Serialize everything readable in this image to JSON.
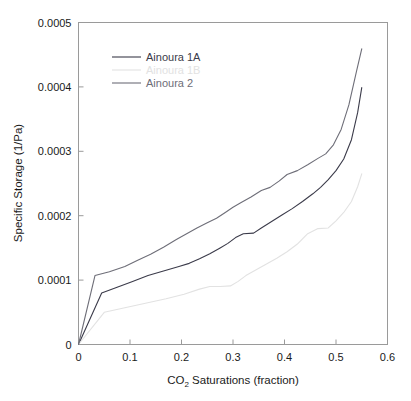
{
  "chart_data": {
    "type": "line",
    "title": "",
    "xlabel": "CO2 Saturations (fraction)",
    "xlabel_main": "CO",
    "xlabel_sub": "2",
    "xlabel_rest": " Saturations (fraction)",
    "ylabel": "Specific Storage (1/Pa)",
    "xlim": [
      0,
      0.6
    ],
    "ylim": [
      0,
      0.0005
    ],
    "xticks": [
      0,
      0.1,
      0.2,
      0.3,
      0.4,
      0.5,
      0.6
    ],
    "xtick_labels": [
      "0",
      "0.1",
      "0.2",
      "0.3",
      "0.4",
      "0.5",
      "0.6"
    ],
    "yticks": [
      0,
      0.0001,
      0.0002,
      0.0003,
      0.0004,
      0.0005
    ],
    "ytick_labels": [
      "0",
      "0.0001",
      "0.0002",
      "0.0003",
      "0.0004",
      "0.0005"
    ],
    "grid": false,
    "legend_position": "upper-left-inside",
    "series": [
      {
        "name": "Ainoura 1A",
        "color": "#3b3b4a",
        "x": [
          0.0,
          0.045,
          0.075,
          0.105,
          0.135,
          0.165,
          0.195,
          0.215,
          0.235,
          0.255,
          0.275,
          0.29,
          0.305,
          0.32,
          0.34,
          0.355,
          0.375,
          0.395,
          0.415,
          0.435,
          0.455,
          0.47,
          0.485,
          0.5,
          0.515,
          0.53,
          0.542,
          0.55
        ],
        "y": [
          0.0,
          8e-05,
          8.9e-05,
          9.8e-05,
          0.000107,
          0.000114,
          0.000121,
          0.000126,
          0.000133,
          0.000141,
          0.00015,
          0.000157,
          0.000166,
          0.000172,
          0.000173,
          0.000181,
          0.000191,
          0.000201,
          0.000211,
          0.000222,
          0.000234,
          0.000244,
          0.000256,
          0.00027,
          0.000288,
          0.000318,
          0.00036,
          0.000399
        ]
      },
      {
        "name": "Ainoura 1B",
        "color": "#e2e2e2",
        "x": [
          0.0,
          0.05,
          0.09,
          0.13,
          0.17,
          0.205,
          0.235,
          0.255,
          0.275,
          0.295,
          0.31,
          0.325,
          0.345,
          0.365,
          0.385,
          0.405,
          0.425,
          0.445,
          0.465,
          0.485,
          0.5,
          0.515,
          0.53,
          0.542,
          0.55
        ],
        "y": [
          0.0,
          5e-05,
          5.7e-05,
          6.4e-05,
          7.1e-05,
          7.8e-05,
          8.6e-05,
          9e-05,
          9e-05,
          9.1e-05,
          9.8e-05,
          0.000107,
          0.000116,
          0.000125,
          0.000134,
          0.000144,
          0.000156,
          0.000172,
          0.00018,
          0.000181,
          0.000192,
          0.000205,
          0.000222,
          0.000245,
          0.000265
        ]
      },
      {
        "name": "Ainoura 2",
        "color": "#6e6e78",
        "x": [
          0.0,
          0.032,
          0.06,
          0.09,
          0.115,
          0.14,
          0.165,
          0.19,
          0.21,
          0.23,
          0.25,
          0.268,
          0.285,
          0.3,
          0.315,
          0.335,
          0.355,
          0.372,
          0.39,
          0.405,
          0.425,
          0.445,
          0.465,
          0.48,
          0.495,
          0.51,
          0.525,
          0.54,
          0.55
        ],
        "y": [
          0.0,
          0.000107,
          0.000113,
          0.000121,
          0.000131,
          0.00014,
          0.000151,
          0.000163,
          0.000172,
          0.000181,
          0.000189,
          0.000196,
          0.000205,
          0.000213,
          0.00022,
          0.000229,
          0.000239,
          0.000244,
          0.000254,
          0.000264,
          0.00027,
          0.000279,
          0.000289,
          0.000296,
          0.00031,
          0.000334,
          0.000372,
          0.000425,
          0.000459
        ]
      }
    ]
  },
  "legend": {
    "entries": [
      {
        "label": "Ainoura 1A",
        "color": "#3b3b4a"
      },
      {
        "label": "Ainoura 1B",
        "color": "#e2e2e2"
      },
      {
        "label": "Ainoura 2",
        "color": "#6e6e78"
      }
    ]
  }
}
